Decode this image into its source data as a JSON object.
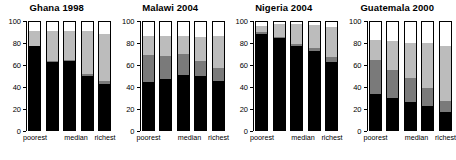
{
  "chart_data": {
    "type": "bar",
    "title": "",
    "subtitle": "",
    "xlabel": "",
    "ylabel": "",
    "ylim": [
      0,
      100
    ],
    "yticks": [
      0,
      20,
      40,
      60,
      80,
      100
    ],
    "grid": false,
    "legend": "none",
    "stacked": true,
    "stack_order": "bottom-to-top",
    "categories": [
      "poorest",
      "",
      "median",
      "",
      "richest"
    ],
    "category_labels_shown": [
      "poorest",
      "median",
      "richest"
    ],
    "segment_names": [
      "black",
      "dark-gray",
      "light-gray",
      "white"
    ],
    "segment_colors": [
      "#000000",
      "#7a7a7a",
      "#bcbcbc",
      "#ffffff"
    ],
    "panels": [
      {
        "title": "Ghana 1998",
        "bars": [
          {
            "category": "poorest",
            "values": [
              78,
              0,
              14,
              8
            ]
          },
          {
            "category": "q2",
            "values": [
              63,
              1,
              28,
              8
            ]
          },
          {
            "category": "median",
            "values": [
              64,
              1,
              27,
              8
            ]
          },
          {
            "category": "q4",
            "values": [
              50,
              2,
              40,
              8
            ]
          },
          {
            "category": "richest",
            "values": [
              43,
              2,
              44,
              11
            ]
          }
        ]
      },
      {
        "title": "Malawi 2004",
        "bars": [
          {
            "category": "poorest",
            "values": [
              44,
              25,
              18,
              13
            ]
          },
          {
            "category": "q2",
            "values": [
              47,
              22,
              18,
              13
            ]
          },
          {
            "category": "median",
            "values": [
              51,
              19,
              17,
              13
            ]
          },
          {
            "category": "q4",
            "values": [
              50,
              14,
              22,
              14
            ]
          },
          {
            "category": "richest",
            "values": [
              45,
              12,
              30,
              13
            ]
          }
        ]
      },
      {
        "title": "Nigeria 2004",
        "bars": [
          {
            "category": "poorest",
            "values": [
              89,
              2,
              5,
              4
            ]
          },
          {
            "category": "q2",
            "values": [
              85,
              1,
              12,
              2
            ]
          },
          {
            "category": "median",
            "values": [
              78,
              2,
              18,
              2
            ]
          },
          {
            "category": "q4",
            "values": [
              73,
              3,
              21,
              3
            ]
          },
          {
            "category": "richest",
            "values": [
              63,
              5,
              27,
              5
            ]
          }
        ]
      },
      {
        "title": "Guatemala 2000",
        "bars": [
          {
            "category": "poorest",
            "values": [
              33,
              32,
              18,
              17
            ]
          },
          {
            "category": "q2",
            "values": [
              30,
              26,
              26,
              18
            ]
          },
          {
            "category": "median",
            "values": [
              26,
              22,
              33,
              19
            ]
          },
          {
            "category": "q4",
            "values": [
              22,
              17,
              42,
              19
            ]
          },
          {
            "category": "richest",
            "values": [
              17,
              10,
              51,
              22
            ]
          }
        ]
      }
    ]
  }
}
